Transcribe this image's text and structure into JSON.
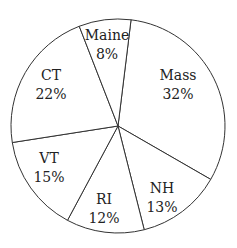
{
  "chart_data": {
    "type": "pie",
    "title": "",
    "start_angle_deg": 7,
    "slices": [
      {
        "label": "Mass",
        "value": 32,
        "pct": "32%",
        "lx": 178,
        "ly": 85
      },
      {
        "label": "NH",
        "value": 13,
        "pct": "13%",
        "lx": 162,
        "ly": 198
      },
      {
        "label": "RI",
        "value": 12,
        "pct": "12%",
        "lx": 104,
        "ly": 209
      },
      {
        "label": "VT",
        "value": 15,
        "pct": "15%",
        "lx": 49,
        "ly": 168
      },
      {
        "label": "CT",
        "value": 22,
        "pct": "22%",
        "lx": 51,
        "ly": 85
      },
      {
        "label": "Maine",
        "value": 8,
        "pct": "8%",
        "lx": 107,
        "ly": 45
      }
    ]
  }
}
